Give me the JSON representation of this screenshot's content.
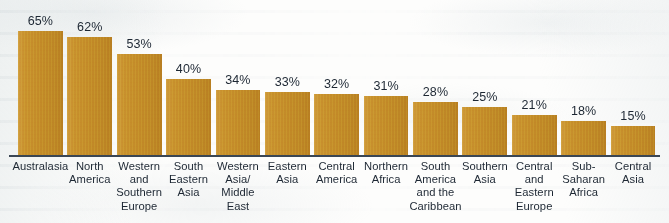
{
  "chart_data": {
    "type": "bar",
    "title": "",
    "subtitle": "",
    "xlabel": "",
    "ylabel": "",
    "ylim": [
      0,
      65
    ],
    "grid": false,
    "legend": "none",
    "orientation": "vertical",
    "value_label_suffix": "%",
    "bar_color": "#c28a28",
    "axis_color": "#3a4654",
    "text_color": "#1d2733",
    "background_color": "#fdfdfc",
    "categories": [
      "Australasia",
      "North America",
      "Western and Southern Europe",
      "South Eastern Asia",
      "Western Asia/ Middle East",
      "Eastern Asia",
      "Central America",
      "Northern Africa",
      "South America and the Caribbean",
      "Southern Asia",
      "Central and Eastern Europe",
      "Sub-Saharan Africa",
      "Central Asia"
    ],
    "category_lines": [
      [
        "Australasia"
      ],
      [
        "North",
        "America"
      ],
      [
        "Western",
        "and",
        "Southern",
        "Europe"
      ],
      [
        "South",
        "Eastern",
        "Asia"
      ],
      [
        "Western",
        "Asia/",
        "Middle",
        "East"
      ],
      [
        "Eastern",
        "Asia"
      ],
      [
        "Central",
        "America"
      ],
      [
        "Northern",
        "Africa"
      ],
      [
        "South",
        "America",
        "and the",
        "Caribbean"
      ],
      [
        "Southern",
        "Asia"
      ],
      [
        "Central",
        "and",
        "Eastern",
        "Europe"
      ],
      [
        "Sub-",
        "Saharan",
        "Africa"
      ],
      [
        "Central",
        "Asia"
      ]
    ],
    "values": [
      65,
      62,
      53,
      40,
      34,
      33,
      32,
      31,
      28,
      25,
      21,
      18,
      15
    ],
    "value_labels": [
      "65%",
      "62%",
      "53%",
      "40%",
      "34%",
      "33%",
      "32%",
      "31%",
      "28%",
      "25%",
      "21%",
      "18%",
      "15%"
    ]
  }
}
